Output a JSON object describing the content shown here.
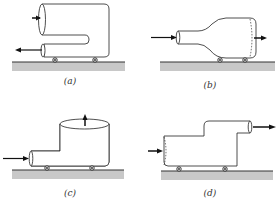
{
  "figure": {
    "panels": [
      {
        "id": "a",
        "label": "(a)",
        "description": "U-shaped pipe on cart: inlet arrow entering upper large opening, outlet arrow leaving lower narrow pipe to the left"
      },
      {
        "id": "b",
        "label": "(b)",
        "description": "Bottle-shaped converging/diverging pipe on cart: inflow from narrow neck at left, outflow from wide end at right"
      },
      {
        "id": "c",
        "label": "(c)",
        "description": "Pipe with vertical cylindrical tank on cart: inflow from left narrow pipe, outflow upward from open top"
      },
      {
        "id": "d",
        "label": "(d)",
        "description": "Stepped pipe on cart: inflow at wide left end, outflow through raised narrow pipe to the right"
      }
    ],
    "colors": {
      "line": "#222222",
      "ground": "#c8c8c8",
      "ground_line": "#333333"
    }
  }
}
